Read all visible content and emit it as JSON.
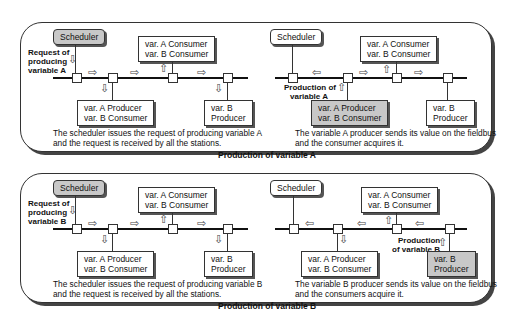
{
  "panels": [
    {
      "title": "Production of variable A",
      "left": {
        "scheduler": "Scheduler",
        "request_label": [
          "Request of",
          "producing",
          "variable A"
        ],
        "consumer_box": [
          "var. A Consumer",
          "var. B Consumer"
        ],
        "producer_box": [
          "var. A Producer",
          "var. B Consumer"
        ],
        "b_producer_box": [
          "var. B",
          "Producer"
        ],
        "caption": [
          "The scheduler issues the request of producing variable A",
          "and the request is received by all the stations."
        ]
      },
      "right": {
        "scheduler": "Scheduler",
        "production_label": [
          "Production of",
          "variable A"
        ],
        "consumer_box": [
          "var. A Consumer",
          "var. B Consumer"
        ],
        "producer_box": [
          "var. A Producer",
          "var. B Consumer"
        ],
        "b_producer_box": [
          "var. B",
          "Producer"
        ],
        "caption": [
          "The variable A producer sends its value on the fieldbus",
          "and the consumer acquires it."
        ]
      }
    },
    {
      "title": "Production of variable B",
      "left": {
        "scheduler": "Scheduler",
        "request_label": [
          "Request of",
          "producing",
          "variable B"
        ],
        "consumer_box": [
          "var. A Consumer",
          "var. B Consumer"
        ],
        "producer_box": [
          "var. A Producer",
          "var. B Consumer"
        ],
        "b_producer_box": [
          "var. B",
          "Producer"
        ],
        "caption": [
          "The scheduler issues the request of producing variable B",
          "and the request is received by all the stations."
        ]
      },
      "right": {
        "scheduler": "Scheduler",
        "production_label": [
          "Production",
          "of variable B"
        ],
        "consumer_box": [
          "var. A Consumer",
          "var. B Consumer"
        ],
        "producer_box": [
          "var. A Producer",
          "var. B Consumer"
        ],
        "b_producer_box": [
          "var. B",
          "Producer"
        ],
        "caption": [
          "The variable B producer sends its value on the fieldbus",
          "and the consumers acquire it."
        ]
      }
    }
  ],
  "icons": {
    "arrow_right": "⇨",
    "arrow_left": "⇦",
    "arrow_up": "⇧",
    "arrow_down": "⇩"
  }
}
